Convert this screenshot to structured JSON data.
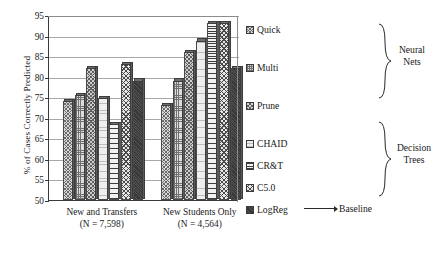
{
  "chart_data": {
    "type": "bar",
    "title": "",
    "xlabel": "",
    "ylabel": "% of Cases Correctly Predicted",
    "ylim": [
      50,
      95
    ],
    "yticks": [
      50,
      55,
      60,
      65,
      70,
      75,
      80,
      85,
      90,
      95
    ],
    "grid": true,
    "legend_position": "right",
    "categories": [
      "New and Transfers\n(N = 7,598)",
      "New Students Only\n(N = 4,564)"
    ],
    "category_labels": [
      {
        "line1": "New and Transfers",
        "line2": "(N = 7,598)"
      },
      {
        "line1": "New Students Only",
        "line2": "(N = 4,564)"
      }
    ],
    "series": [
      {
        "name": "Quick",
        "group": "Neural Nets",
        "pattern": "crosshatch-diagonal",
        "values": [
          74.0,
          73.0
        ]
      },
      {
        "name": "Multi",
        "group": "Neural Nets",
        "pattern": "grid-fine",
        "values": [
          75.5,
          79.0
        ]
      },
      {
        "name": "Prune",
        "group": "Neural Nets",
        "pattern": "dense-crosshatch",
        "values": [
          82.0,
          86.0
        ]
      },
      {
        "name": "CHAID",
        "group": "Decision Trees",
        "pattern": "light-horizontal",
        "values": [
          74.8,
          88.8
        ]
      },
      {
        "name": "CR&T",
        "group": "Decision Trees",
        "pattern": "horizontal-lines",
        "values": [
          68.5,
          93.0
        ]
      },
      {
        "name": "C5.0",
        "group": "Decision Trees",
        "pattern": "diamond-crosshatch",
        "values": [
          83.0,
          93.0
        ]
      },
      {
        "name": "LogReg",
        "group": "Baseline",
        "pattern": "solid-dark",
        "values": [
          79.0,
          82.0
        ]
      }
    ]
  },
  "legend": {
    "entries": [
      {
        "label": "Quick",
        "swatch": "crosshatch-diagonal"
      },
      {
        "label": "Multi",
        "swatch": "grid-fine"
      },
      {
        "label": "Prune",
        "swatch": "dense-crosshatch"
      },
      {
        "label": "CHAID",
        "swatch": "light-horizontal"
      },
      {
        "label": "CR&T",
        "swatch": "horizontal-lines"
      },
      {
        "label": "C5.0",
        "swatch": "diamond-crosshatch"
      },
      {
        "label": "LogReg",
        "swatch": "solid-dark"
      }
    ],
    "groups": [
      {
        "line1": "Neural",
        "line2": "Nets"
      },
      {
        "line1": "Decision",
        "line2": "Trees"
      }
    ],
    "baseline_label": "Baseline"
  },
  "axis": {
    "y_title": "% of Cases Correctly Predicted",
    "ytick_labels": [
      "95",
      "90",
      "85",
      "80",
      "75",
      "70",
      "65",
      "60",
      "55",
      "50"
    ]
  }
}
